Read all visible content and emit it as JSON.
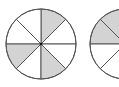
{
  "figure": {
    "colors": {
      "shade": "#d3d3d3",
      "stroke": "#555555",
      "background": "#ffffff",
      "center_dot": "#111111"
    },
    "circles": [
      {
        "id": "circle-1",
        "cx": 41,
        "cy": 44,
        "r": 35,
        "divisions": 8,
        "shaded_sectors": [
          1,
          6,
          4
        ],
        "visible": "full"
      },
      {
        "id": "circle-2",
        "cx": 125,
        "cy": 44,
        "r": 35,
        "divisions": 8,
        "shaded_sectors": [
          2,
          3
        ],
        "visible": "partially clipped on right"
      }
    ]
  }
}
